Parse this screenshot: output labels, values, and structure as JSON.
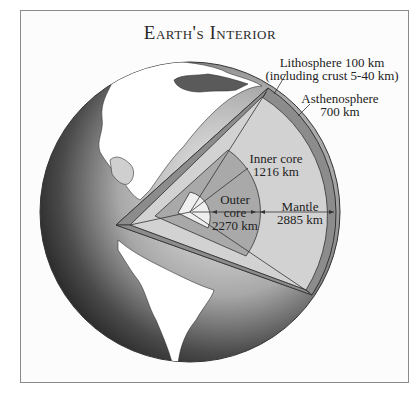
{
  "title": "Earth's Interior",
  "labels": {
    "lithosphere_line1": "Lithosphere 100 km",
    "lithosphere_line2": "(including crust 5-40 km)",
    "asthenosphere_line1": "Asthenosphere",
    "asthenosphere_line2": "700 km",
    "inner_core_line1": "Inner core",
    "inner_core_line2": "1216 km",
    "outer_core_line1": "Outer",
    "outer_core_line2": "core",
    "outer_core_line3": "2270 km",
    "mantle_line1": "Mantle",
    "mantle_line2": "2885 km"
  },
  "colors": {
    "mantle": "#d2d2d2",
    "outer_core": "#a9a9a9",
    "inner_core": "#efefef",
    "lithosphere": "#8c8c8c",
    "ocean_dark": "#3a3a3a",
    "land": "#ffffff"
  }
}
